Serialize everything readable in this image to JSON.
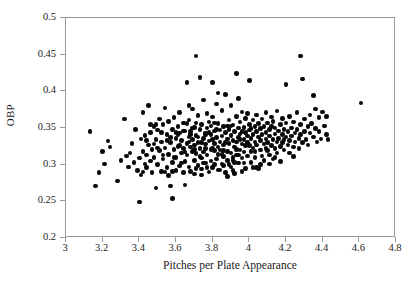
{
  "chart_data": {
    "type": "scatter",
    "title": "",
    "xlabel": "Pitches per Plate Appearance",
    "ylabel": "OBP",
    "xlim": [
      3,
      4.8
    ],
    "ylim": [
      0.2,
      0.5
    ],
    "xticks": [
      "3",
      "3.2",
      "3.4",
      "3.6",
      "3.8",
      "4",
      "4.2",
      "4.4",
      "4.6",
      "4.8"
    ],
    "xtick_values": [
      3,
      3.2,
      3.4,
      3.6,
      3.8,
      4,
      4.2,
      4.4,
      4.6,
      4.8
    ],
    "yticks": [
      "0.2",
      "0.25",
      "0.3",
      "0.35",
      "0.4",
      "0.45",
      "0.5"
    ],
    "ytick_values": [
      0.2,
      0.25,
      0.3,
      0.35,
      0.4,
      0.45,
      0.5
    ],
    "grid": false,
    "legend": null,
    "marker": {
      "shape": "circle",
      "color": "#080808",
      "size_px": 4.6,
      "filled": true
    },
    "frame_color": "#9a9a9a",
    "background": "#ffffff",
    "n_points": 352,
    "points": [
      [
        3.13,
        0.345
      ],
      [
        3.16,
        0.271
      ],
      [
        3.18,
        0.289
      ],
      [
        3.2,
        0.318
      ],
      [
        3.21,
        0.301
      ],
      [
        3.23,
        0.332
      ],
      [
        3.24,
        0.324
      ],
      [
        3.28,
        0.278
      ],
      [
        3.3,
        0.306
      ],
      [
        3.32,
        0.362
      ],
      [
        3.33,
        0.312
      ],
      [
        3.34,
        0.297
      ],
      [
        3.35,
        0.316
      ],
      [
        3.36,
        0.329
      ],
      [
        3.37,
        0.303
      ],
      [
        3.38,
        0.348
      ],
      [
        3.39,
        0.292
      ],
      [
        3.4,
        0.249
      ],
      [
        3.4,
        0.309
      ],
      [
        3.41,
        0.335
      ],
      [
        3.41,
        0.286
      ],
      [
        3.42,
        0.318
      ],
      [
        3.42,
        0.371
      ],
      [
        3.43,
        0.301
      ],
      [
        3.43,
        0.34
      ],
      [
        3.44,
        0.313
      ],
      [
        3.44,
        0.296
      ],
      [
        3.45,
        0.327
      ],
      [
        3.45,
        0.381
      ],
      [
        3.46,
        0.305
      ],
      [
        3.46,
        0.344
      ],
      [
        3.47,
        0.289
      ],
      [
        3.47,
        0.321
      ],
      [
        3.48,
        0.352
      ],
      [
        3.48,
        0.31
      ],
      [
        3.49,
        0.334
      ],
      [
        3.49,
        0.268
      ],
      [
        3.5,
        0.3
      ],
      [
        3.5,
        0.347
      ],
      [
        3.51,
        0.319
      ],
      [
        3.51,
        0.362
      ],
      [
        3.52,
        0.291
      ],
      [
        3.52,
        0.331
      ],
      [
        3.53,
        0.308
      ],
      [
        3.53,
        0.355
      ],
      [
        3.54,
        0.377
      ],
      [
        3.54,
        0.323
      ],
      [
        3.55,
        0.296
      ],
      [
        3.55,
        0.341
      ],
      [
        3.56,
        0.314
      ],
      [
        3.56,
        0.359
      ],
      [
        3.57,
        0.271
      ],
      [
        3.57,
        0.33
      ],
      [
        3.58,
        0.254
      ],
      [
        3.58,
        0.303
      ],
      [
        3.58,
        0.348
      ],
      [
        3.59,
        0.321
      ],
      [
        3.59,
        0.364
      ],
      [
        3.6,
        0.292
      ],
      [
        3.6,
        0.336
      ],
      [
        3.6,
        0.31
      ],
      [
        3.61,
        0.352
      ],
      [
        3.61,
        0.325
      ],
      [
        3.62,
        0.298
      ],
      [
        3.62,
        0.343
      ],
      [
        3.62,
        0.371
      ],
      [
        3.63,
        0.316
      ],
      [
        3.63,
        0.333
      ],
      [
        3.64,
        0.289
      ],
      [
        3.64,
        0.357
      ],
      [
        3.64,
        0.322
      ],
      [
        3.65,
        0.304
      ],
      [
        3.65,
        0.346
      ],
      [
        3.65,
        0.272
      ],
      [
        3.66,
        0.329
      ],
      [
        3.66,
        0.412
      ],
      [
        3.66,
        0.313
      ],
      [
        3.67,
        0.338
      ],
      [
        3.67,
        0.297
      ],
      [
        3.67,
        0.361
      ],
      [
        3.68,
        0.324
      ],
      [
        3.68,
        0.345
      ],
      [
        3.68,
        0.291
      ],
      [
        3.69,
        0.318
      ],
      [
        3.69,
        0.376
      ],
      [
        3.69,
        0.334
      ],
      [
        3.7,
        0.306
      ],
      [
        3.7,
        0.351
      ],
      [
        3.7,
        0.327
      ],
      [
        3.7,
        0.287
      ],
      [
        3.71,
        0.448
      ],
      [
        3.71,
        0.34
      ],
      [
        3.71,
        0.315
      ],
      [
        3.72,
        0.367
      ],
      [
        3.72,
        0.33
      ],
      [
        3.72,
        0.299
      ],
      [
        3.73,
        0.419
      ],
      [
        3.73,
        0.348
      ],
      [
        3.73,
        0.322
      ],
      [
        3.74,
        0.309
      ],
      [
        3.74,
        0.355
      ],
      [
        3.74,
        0.294
      ],
      [
        3.75,
        0.336
      ],
      [
        3.75,
        0.388
      ],
      [
        3.75,
        0.317
      ],
      [
        3.76,
        0.343
      ],
      [
        3.76,
        0.302
      ],
      [
        3.76,
        0.328
      ],
      [
        3.77,
        0.37
      ],
      [
        3.77,
        0.313
      ],
      [
        3.77,
        0.35
      ],
      [
        3.78,
        0.332
      ],
      [
        3.78,
        0.29
      ],
      [
        3.78,
        0.358
      ],
      [
        3.79,
        0.321
      ],
      [
        3.79,
        0.341
      ],
      [
        3.79,
        0.305
      ],
      [
        3.8,
        0.412
      ],
      [
        3.8,
        0.334
      ],
      [
        3.8,
        0.296
      ],
      [
        3.8,
        0.365
      ],
      [
        3.81,
        0.319
      ],
      [
        3.81,
        0.346
      ],
      [
        3.81,
        0.329
      ],
      [
        3.82,
        0.308
      ],
      [
        3.82,
        0.383
      ],
      [
        3.82,
        0.337
      ],
      [
        3.83,
        0.314
      ],
      [
        3.83,
        0.356
      ],
      [
        3.83,
        0.293
      ],
      [
        3.84,
        0.331
      ],
      [
        3.84,
        0.347
      ],
      [
        3.84,
        0.32
      ],
      [
        3.85,
        0.301
      ],
      [
        3.85,
        0.374
      ],
      [
        3.85,
        0.339
      ],
      [
        3.86,
        0.311
      ],
      [
        3.86,
        0.352
      ],
      [
        3.86,
        0.327
      ],
      [
        3.87,
        0.289
      ],
      [
        3.87,
        0.344
      ],
      [
        3.87,
        0.396
      ],
      [
        3.88,
        0.318
      ],
      [
        3.88,
        0.335
      ],
      [
        3.88,
        0.306
      ],
      [
        3.89,
        0.361
      ],
      [
        3.89,
        0.329
      ],
      [
        3.89,
        0.348
      ],
      [
        3.9,
        0.297
      ],
      [
        3.9,
        0.34
      ],
      [
        3.9,
        0.316
      ],
      [
        3.9,
        0.381
      ],
      [
        3.91,
        0.333
      ],
      [
        3.91,
        0.354
      ],
      [
        3.91,
        0.31
      ],
      [
        3.92,
        0.324
      ],
      [
        3.92,
        0.345
      ],
      [
        3.92,
        0.288
      ],
      [
        3.93,
        0.366
      ],
      [
        3.93,
        0.331
      ],
      [
        3.93,
        0.313
      ],
      [
        3.93,
        0.424
      ],
      [
        3.94,
        0.35
      ],
      [
        3.94,
        0.337
      ],
      [
        3.94,
        0.302
      ],
      [
        3.95,
        0.32
      ],
      [
        3.95,
        0.358
      ],
      [
        3.95,
        0.342
      ],
      [
        3.96,
        0.328
      ],
      [
        3.96,
        0.309
      ],
      [
        3.96,
        0.372
      ],
      [
        3.97,
        0.334
      ],
      [
        3.97,
        0.351
      ],
      [
        3.97,
        0.317
      ],
      [
        3.98,
        0.344
      ],
      [
        3.98,
        0.295
      ],
      [
        3.98,
        0.363
      ],
      [
        3.99,
        0.33
      ],
      [
        3.99,
        0.339
      ],
      [
        3.99,
        0.312
      ],
      [
        4.0,
        0.355
      ],
      [
        4.0,
        0.326
      ],
      [
        4.0,
        0.347
      ],
      [
        4.0,
        0.415
      ],
      [
        4.01,
        0.318
      ],
      [
        4.01,
        0.336
      ],
      [
        4.01,
        0.303
      ],
      [
        4.02,
        0.361
      ],
      [
        4.02,
        0.341
      ],
      [
        4.02,
        0.323
      ],
      [
        4.03,
        0.352
      ],
      [
        4.03,
        0.331
      ],
      [
        4.03,
        0.31
      ],
      [
        4.04,
        0.345
      ],
      [
        4.04,
        0.368
      ],
      [
        4.04,
        0.327
      ],
      [
        4.05,
        0.338
      ],
      [
        4.05,
        0.295
      ],
      [
        4.05,
        0.356
      ],
      [
        4.06,
        0.32
      ],
      [
        4.06,
        0.349
      ],
      [
        4.06,
        0.333
      ],
      [
        4.07,
        0.312
      ],
      [
        4.07,
        0.362
      ],
      [
        4.07,
        0.341
      ],
      [
        4.08,
        0.328
      ],
      [
        4.08,
        0.352
      ],
      [
        4.08,
        0.306
      ],
      [
        4.09,
        0.335
      ],
      [
        4.09,
        0.371
      ],
      [
        4.09,
        0.344
      ],
      [
        4.1,
        0.319
      ],
      [
        4.1,
        0.357
      ],
      [
        4.1,
        0.33
      ],
      [
        4.11,
        0.348
      ],
      [
        4.11,
        0.313
      ],
      [
        4.11,
        0.339
      ],
      [
        4.12,
        0.365
      ],
      [
        4.12,
        0.326
      ],
      [
        4.12,
        0.352
      ],
      [
        4.13,
        0.334
      ],
      [
        4.13,
        0.308
      ],
      [
        4.13,
        0.359
      ],
      [
        4.14,
        0.342
      ],
      [
        4.14,
        0.322
      ],
      [
        4.14,
        0.35
      ],
      [
        4.15,
        0.331
      ],
      [
        4.15,
        0.373
      ],
      [
        4.15,
        0.316
      ],
      [
        4.16,
        0.346
      ],
      [
        4.16,
        0.336
      ],
      [
        4.17,
        0.355
      ],
      [
        4.17,
        0.325
      ],
      [
        4.17,
        0.304
      ],
      [
        4.18,
        0.341
      ],
      [
        4.18,
        0.363
      ],
      [
        4.18,
        0.33
      ],
      [
        4.19,
        0.348
      ],
      [
        4.19,
        0.32
      ],
      [
        4.2,
        0.338
      ],
      [
        4.2,
        0.357
      ],
      [
        4.2,
        0.409
      ],
      [
        4.21,
        0.327
      ],
      [
        4.21,
        0.345
      ],
      [
        4.22,
        0.333
      ],
      [
        4.22,
        0.366
      ],
      [
        4.22,
        0.316
      ],
      [
        4.23,
        0.35
      ],
      [
        4.23,
        0.339
      ],
      [
        4.24,
        0.324
      ],
      [
        4.24,
        0.358
      ],
      [
        4.25,
        0.343
      ],
      [
        4.25,
        0.331
      ],
      [
        4.26,
        0.371
      ],
      [
        4.26,
        0.348
      ],
      [
        4.27,
        0.322
      ],
      [
        4.27,
        0.336
      ],
      [
        4.28,
        0.448
      ],
      [
        4.28,
        0.355
      ],
      [
        4.28,
        0.341
      ],
      [
        4.29,
        0.417
      ],
      [
        4.29,
        0.33
      ],
      [
        4.3,
        0.362
      ],
      [
        4.3,
        0.345
      ],
      [
        4.31,
        0.334
      ],
      [
        4.32,
        0.352
      ],
      [
        4.32,
        0.327
      ],
      [
        4.33,
        0.368
      ],
      [
        4.33,
        0.343
      ],
      [
        4.34,
        0.356
      ],
      [
        4.35,
        0.338
      ],
      [
        4.35,
        0.394
      ],
      [
        4.36,
        0.349
      ],
      [
        4.36,
        0.376
      ],
      [
        4.37,
        0.331
      ],
      [
        4.38,
        0.364
      ],
      [
        4.38,
        0.345
      ],
      [
        4.39,
        0.335
      ],
      [
        4.4,
        0.372
      ],
      [
        4.41,
        0.353
      ],
      [
        4.42,
        0.341
      ],
      [
        4.42,
        0.366
      ],
      [
        4.43,
        0.334
      ],
      [
        4.61,
        0.384
      ],
      [
        3.55,
        0.333
      ],
      [
        3.62,
        0.326
      ],
      [
        3.68,
        0.341
      ],
      [
        3.73,
        0.311
      ],
      [
        3.78,
        0.344
      ],
      [
        3.83,
        0.324
      ],
      [
        3.88,
        0.353
      ],
      [
        3.93,
        0.321
      ],
      [
        3.98,
        0.326
      ],
      [
        4.03,
        0.318
      ],
      [
        3.59,
        0.31
      ],
      [
        3.66,
        0.356
      ],
      [
        3.71,
        0.295
      ],
      [
        3.76,
        0.322
      ],
      [
        3.81,
        0.3
      ],
      [
        3.86,
        0.319
      ],
      [
        3.91,
        0.306
      ],
      [
        3.96,
        0.291
      ],
      [
        4.01,
        0.349
      ],
      [
        4.06,
        0.3
      ],
      [
        3.52,
        0.344
      ],
      [
        3.57,
        0.337
      ],
      [
        3.63,
        0.302
      ],
      [
        3.69,
        0.35
      ],
      [
        3.74,
        0.33
      ],
      [
        3.79,
        0.353
      ],
      [
        3.84,
        0.293
      ],
      [
        3.89,
        0.3
      ],
      [
        3.94,
        0.313
      ],
      [
        3.99,
        0.37
      ],
      [
        3.48,
        0.328
      ],
      [
        3.53,
        0.313
      ],
      [
        3.61,
        0.341
      ],
      [
        3.67,
        0.331
      ],
      [
        3.72,
        0.338
      ],
      [
        3.77,
        0.296
      ],
      [
        3.82,
        0.348
      ],
      [
        3.87,
        0.33
      ],
      [
        3.92,
        0.303
      ],
      [
        3.97,
        0.302
      ],
      [
        3.44,
        0.333
      ],
      [
        3.5,
        0.323
      ],
      [
        3.58,
        0.291
      ],
      [
        3.64,
        0.346
      ],
      [
        3.7,
        0.321
      ],
      [
        3.75,
        0.302
      ],
      [
        3.8,
        0.322
      ],
      [
        3.85,
        0.314
      ],
      [
        3.9,
        0.353
      ],
      [
        3.95,
        0.334
      ],
      [
        3.46,
        0.355
      ],
      [
        3.54,
        0.29
      ],
      [
        3.6,
        0.344
      ],
      [
        3.65,
        0.317
      ],
      [
        3.71,
        0.357
      ],
      [
        3.76,
        0.341
      ],
      [
        3.81,
        0.357
      ],
      [
        3.86,
        0.299
      ],
      [
        3.91,
        0.292
      ],
      [
        3.96,
        0.345
      ],
      [
        4.04,
        0.296
      ],
      [
        4.09,
        0.322
      ],
      [
        4.14,
        0.31
      ],
      [
        4.19,
        0.334
      ],
      [
        4.24,
        0.311
      ],
      [
        3.42,
        0.29
      ],
      [
        3.49,
        0.355
      ],
      [
        3.56,
        0.285
      ],
      [
        3.67,
        0.381
      ],
      [
        3.74,
        0.286
      ],
      [
        3.83,
        0.398
      ],
      [
        3.88,
        0.284
      ],
      [
        3.94,
        0.39
      ],
      [
        4.02,
        0.296
      ],
      [
        4.11,
        0.301
      ]
    ]
  }
}
